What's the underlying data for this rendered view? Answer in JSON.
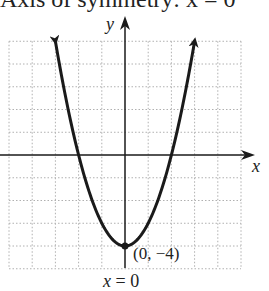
{
  "header_text": "Axis of symmetry: x = 0",
  "chart_data": {
    "type": "line",
    "title": "Axis of symmetry: x = 0",
    "function": "y = x^2 - 4",
    "xlabel": "x",
    "ylabel": "y",
    "xlim": [
      -5,
      5
    ],
    "ylim": [
      -5,
      5
    ],
    "grid": true,
    "grid_step": 1,
    "series": [
      {
        "name": "parabola",
        "x": [
          -3,
          -2.5,
          -2,
          -1.5,
          -1,
          -0.5,
          0,
          0.5,
          1,
          1.5,
          2,
          2.5,
          3
        ],
        "y": [
          5,
          2.25,
          0,
          -1.75,
          -3,
          -3.75,
          -4,
          -3.75,
          -3,
          -1.75,
          0,
          2.25,
          5
        ],
        "arrows_at_ends": true
      }
    ],
    "annotations": [
      {
        "text": "(0, −4)",
        "x": 0,
        "y": -4,
        "kind": "vertex-point"
      },
      {
        "text": "x = 0",
        "kind": "axis-of-symmetry-label"
      }
    ],
    "line_color": "#1a1a1a",
    "grid_color": "#b0b0b0"
  },
  "labels": {
    "x_axis": "x",
    "y_axis": "y",
    "vertex": "(0, −4)",
    "symmetry": "x = 0"
  }
}
